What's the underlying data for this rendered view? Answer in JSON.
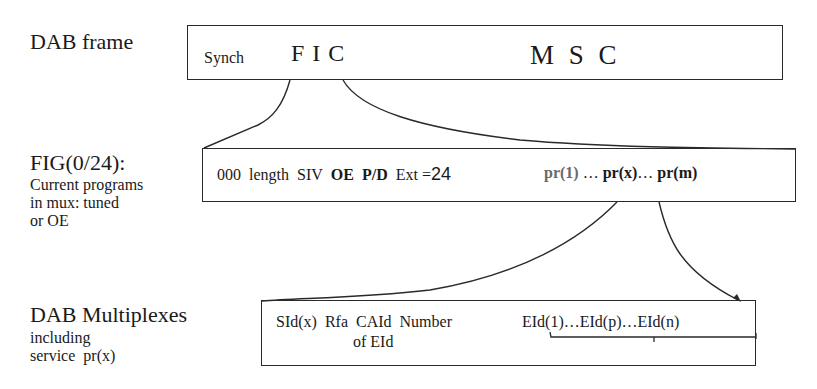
{
  "diagram": {
    "type": "hierarchical-field-breakdown",
    "colors": {
      "line": "#2a2a2a",
      "text": "#1a1a1a",
      "muted_text": "#6a6a6a",
      "background": "#ffffff"
    }
  },
  "levels": [
    {
      "id": "dab-frame",
      "label": "DAB frame",
      "sublabel": [],
      "fields": {
        "synch": "Synch",
        "fic": "F I C",
        "msc": "M S C"
      }
    },
    {
      "id": "fig-0-24",
      "label": "FIG(0/24):",
      "sublabel": [
        "Current programs",
        "in mux: tuned",
        "or OE"
      ],
      "fields": {
        "f000": "000",
        "length": "length",
        "siv": "SIV",
        "oe": "OE",
        "pd": "P/D",
        "ext": "Ext =",
        "ext_value": "24",
        "pr1": "pr(1)",
        "ellipsis1": "…",
        "prx": "pr(x)",
        "ellipsis2": "…",
        "prm": "pr(m)"
      }
    },
    {
      "id": "dab-multiplexes",
      "label": "DAB Multiplexes",
      "sublabel": [
        "including",
        "service  pr(x)"
      ],
      "fields": {
        "sid": "SId(x)",
        "rfa": "Rfa",
        "caid": "CAId",
        "number": "Number",
        "of_eid": "of EId",
        "eid_list": "EId(1)…EId(p)…EId(n)"
      }
    }
  ],
  "connectors": [
    {
      "from": "F I C",
      "to": "FIG(0/24) box",
      "style": "expansion-curves"
    },
    {
      "from": "pr(x)",
      "to": "DAB Multiplexes box",
      "style": "expansion-curves-with-arrow"
    },
    {
      "from": "EId(1)…EId(n)",
      "to": "EId(p)",
      "style": "brace"
    }
  ]
}
